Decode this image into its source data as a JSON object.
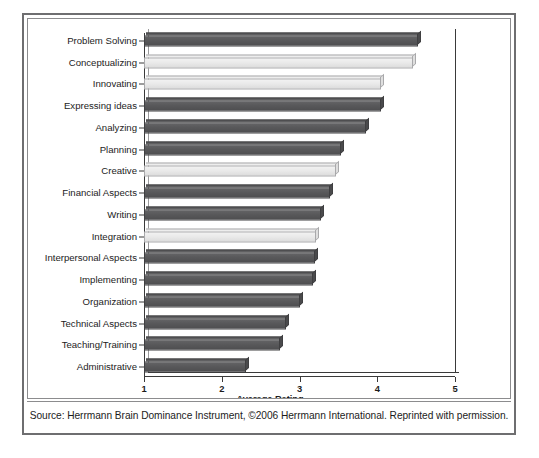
{
  "figure": {
    "source_note": "Source: Herrmann Brain Dominance Instrument, ©2006 Herrmann International. Reprinted with permission."
  },
  "chart_data": {
    "type": "bar",
    "orientation": "horizontal",
    "title": "",
    "xlabel": "Average Rating",
    "ylabel": "",
    "xlim": [
      1,
      5
    ],
    "xticks": [
      1,
      2,
      3,
      4,
      5
    ],
    "xtick_labels": [
      "1",
      "2",
      "3",
      "4",
      "5"
    ],
    "grid": false,
    "legend": "none",
    "colors": {
      "dark_bar": "#58585a",
      "light_bar": "#e9e9e9",
      "axis": "#3a3a3a",
      "frame": "#6e6e70",
      "text": "#1c1c1c"
    },
    "categories": [
      "Problem Solving",
      "Conceptualizing",
      "Innovating",
      "Expressing ideas",
      "Analyzing",
      "Planning",
      "Creative",
      "Financial Aspects",
      "Writing",
      "Integration",
      "Interpersonal Aspects",
      "Implementing",
      "Organization",
      "Technical Aspects",
      "Teaching/Training",
      "Administrative"
    ],
    "values": [
      4.52,
      4.46,
      4.05,
      4.05,
      3.85,
      3.53,
      3.47,
      3.39,
      3.28,
      3.21,
      3.2,
      3.17,
      3.0,
      2.83,
      2.75,
      2.31
    ],
    "highlight": [
      false,
      true,
      true,
      false,
      false,
      false,
      true,
      false,
      false,
      true,
      false,
      false,
      false,
      false,
      false,
      false
    ],
    "series": [
      {
        "name": "Average Rating",
        "values": [
          4.52,
          4.46,
          4.05,
          4.05,
          3.85,
          3.53,
          3.47,
          3.39,
          3.28,
          3.21,
          3.2,
          3.17,
          3.0,
          2.83,
          2.75,
          2.31
        ]
      }
    ]
  }
}
